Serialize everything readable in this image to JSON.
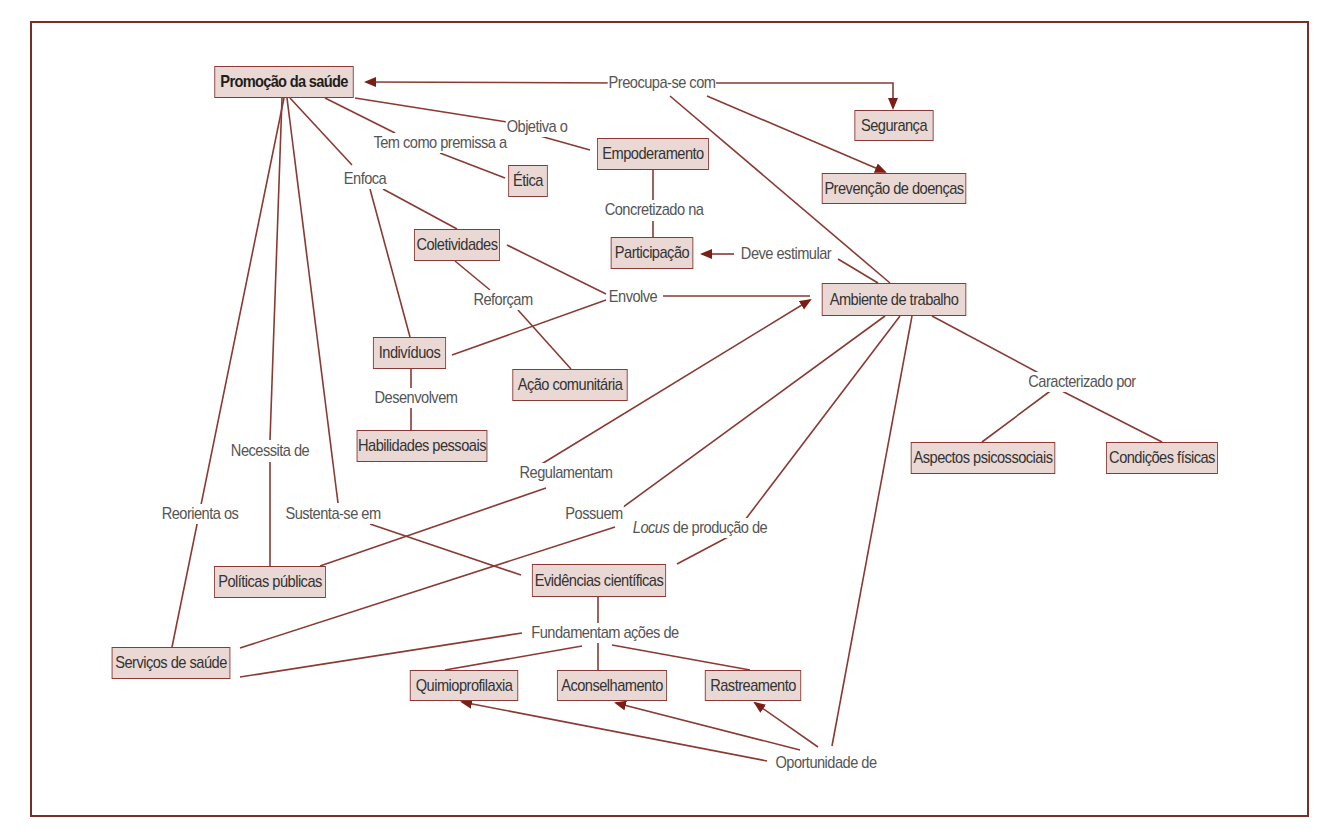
{
  "diagram": {
    "type": "concept-map",
    "colors": {
      "frame": "#7a2e26",
      "edge": "#8a3a32",
      "arrow": "#7a1e16",
      "node_fill": "#ead8d4",
      "node_border": "#8a3a32",
      "label_text": "#555555"
    },
    "nodes": [
      {
        "id": "promocao",
        "label": "Promoção da saúde",
        "x": 203,
        "y": 66,
        "w": 162,
        "h": 32,
        "root": true
      },
      {
        "id": "seguranca",
        "label": "Segurança",
        "x": 848,
        "y": 110,
        "w": 92,
        "h": 31
      },
      {
        "id": "prevencao",
        "label": "Prevenção de doenças",
        "x": 810,
        "y": 173,
        "w": 168,
        "h": 31
      },
      {
        "id": "empoderamento",
        "label": "Empoderamento",
        "x": 588,
        "y": 138,
        "w": 130,
        "h": 32
      },
      {
        "id": "etica",
        "label": "Ética",
        "x": 505,
        "y": 165,
        "w": 46,
        "h": 32
      },
      {
        "id": "coletividades",
        "label": "Coletividades",
        "x": 407,
        "y": 229,
        "w": 100,
        "h": 32
      },
      {
        "id": "participacao",
        "label": "Participação",
        "x": 604,
        "y": 237,
        "w": 96,
        "h": 32
      },
      {
        "id": "ambiente",
        "label": "Ambiente de trabalho",
        "x": 810,
        "y": 283,
        "w": 168,
        "h": 33
      },
      {
        "id": "individuos",
        "label": "Indivíduos",
        "x": 367,
        "y": 337,
        "w": 85,
        "h": 32
      },
      {
        "id": "acao",
        "label": "Ação comunitária",
        "x": 503,
        "y": 369,
        "w": 134,
        "h": 32
      },
      {
        "id": "habilidades",
        "label": "Habilidades pessoais",
        "x": 346,
        "y": 430,
        "w": 152,
        "h": 32
      },
      {
        "id": "aspectos",
        "label": "Aspectos psicossociais",
        "x": 899,
        "y": 442,
        "w": 168,
        "h": 32
      },
      {
        "id": "condicoes",
        "label": "Condições físicas",
        "x": 1097,
        "y": 442,
        "w": 130,
        "h": 32
      },
      {
        "id": "politicas",
        "label": "Políticas públicas",
        "x": 205,
        "y": 566,
        "w": 130,
        "h": 32
      },
      {
        "id": "evidencias",
        "label": "Evidências científicas",
        "x": 521,
        "y": 564,
        "w": 156,
        "h": 33
      },
      {
        "id": "servicos",
        "label": "Serviços de saúde",
        "x": 102,
        "y": 647,
        "w": 138,
        "h": 32
      },
      {
        "id": "quimio",
        "label": "Quimioprofilaxia",
        "x": 401,
        "y": 670,
        "w": 126,
        "h": 31
      },
      {
        "id": "aconselhamento",
        "label": "Aconselhamento",
        "x": 548,
        "y": 670,
        "w": 128,
        "h": 31
      },
      {
        "id": "rastreamento",
        "label": "Rastreamento",
        "x": 697,
        "y": 670,
        "w": 112,
        "h": 31
      }
    ],
    "labels": [
      {
        "id": "preocupa",
        "text": "Preocupa-se com",
        "x": 662,
        "y": 83
      },
      {
        "id": "objetiva",
        "text": "Objetiva o",
        "x": 537,
        "y": 127
      },
      {
        "id": "premissa",
        "text": "Tem como premissa a",
        "x": 440,
        "y": 143
      },
      {
        "id": "enfoca",
        "text": "Enfoca",
        "x": 365,
        "y": 179
      },
      {
        "id": "concretizado",
        "text": "Concretizado na",
        "x": 654,
        "y": 210
      },
      {
        "id": "estimular",
        "text": "Deve estimular",
        "x": 786,
        "y": 254
      },
      {
        "id": "reforcam",
        "text": "Reforçam",
        "x": 503,
        "y": 300
      },
      {
        "id": "envolve",
        "text": "Envolve",
        "x": 633,
        "y": 297
      },
      {
        "id": "desenvolvem",
        "text": "Desenvolvem",
        "x": 416,
        "y": 398
      },
      {
        "id": "caracterizado",
        "text": "Caracterizado por",
        "x": 1082,
        "y": 382
      },
      {
        "id": "necessita",
        "text": "Necessita de",
        "x": 270,
        "y": 451
      },
      {
        "id": "regulamentam",
        "text": "Regulamentam",
        "x": 566,
        "y": 473
      },
      {
        "id": "reorienta",
        "text": "Reorienta os",
        "x": 200,
        "y": 514
      },
      {
        "id": "sustenta",
        "text": "Sustenta-se em",
        "x": 333,
        "y": 514
      },
      {
        "id": "possuem",
        "text": "Possuem",
        "x": 594,
        "y": 514
      },
      {
        "id": "locus",
        "text_italic": "Locus",
        "text": " de produção de",
        "x": 700,
        "y": 528
      },
      {
        "id": "fundamentam",
        "text": "Fundamentam ações de",
        "x": 605,
        "y": 633
      },
      {
        "id": "oportunidade",
        "text": "Oportunidade de",
        "x": 826,
        "y": 763
      }
    ],
    "edges": [
      {
        "points": [
          [
            620,
            83
          ],
          [
            366,
            82
          ]
        ],
        "arrow": "end"
      },
      {
        "points": [
          [
            705,
            83
          ],
          [
            893,
            83
          ],
          [
            893,
            108
          ]
        ],
        "arrow": "end"
      },
      {
        "points": [
          [
            707,
            96
          ],
          [
            885,
            172
          ]
        ],
        "arrow": "end"
      },
      {
        "points": [
          [
            670,
            96
          ],
          [
            890,
            283
          ]
        ],
        "arrow": "none"
      },
      {
        "points": [
          [
            355,
            98
          ],
          [
            507,
            122
          ]
        ],
        "arrow": "none"
      },
      {
        "points": [
          [
            540,
            136
          ],
          [
            590,
            150
          ]
        ],
        "arrow": "none"
      },
      {
        "points": [
          [
            325,
            98
          ],
          [
            395,
            133
          ]
        ],
        "arrow": "none"
      },
      {
        "points": [
          [
            440,
            153
          ],
          [
            505,
            178
          ]
        ],
        "arrow": "none"
      },
      {
        "points": [
          [
            290,
            98
          ],
          [
            352,
            165
          ]
        ],
        "arrow": "none"
      },
      {
        "points": [
          [
            383,
            189
          ],
          [
            457,
            229
          ]
        ],
        "arrow": "none"
      },
      {
        "points": [
          [
            370,
            189
          ],
          [
            410,
            337
          ]
        ],
        "arrow": "none"
      },
      {
        "points": [
          [
            653,
            170
          ],
          [
            653,
            200
          ]
        ],
        "arrow": "none"
      },
      {
        "points": [
          [
            653,
            221
          ],
          [
            653,
            237
          ]
        ],
        "arrow": "none"
      },
      {
        "points": [
          [
            734,
            254
          ],
          [
            702,
            254
          ]
        ],
        "arrow": "end"
      },
      {
        "points": [
          [
            838,
            259
          ],
          [
            878,
            283
          ]
        ],
        "arrow": "none"
      },
      {
        "points": [
          [
            507,
            245
          ],
          [
            606,
            294
          ]
        ],
        "arrow": "none"
      },
      {
        "points": [
          [
            452,
            355
          ],
          [
            606,
            300
          ]
        ],
        "arrow": "none"
      },
      {
        "points": [
          [
            663,
            296
          ],
          [
            810,
            296
          ]
        ],
        "arrow": "none"
      },
      {
        "points": [
          [
            455,
            261
          ],
          [
            490,
            290
          ]
        ],
        "arrow": "none"
      },
      {
        "points": [
          [
            518,
            310
          ],
          [
            571,
            369
          ]
        ],
        "arrow": "none"
      },
      {
        "points": [
          [
            411,
            369
          ],
          [
            411,
            388
          ]
        ],
        "arrow": "none"
      },
      {
        "points": [
          [
            411,
            408
          ],
          [
            411,
            430
          ]
        ],
        "arrow": "none"
      },
      {
        "points": [
          [
            932,
            316
          ],
          [
            1048,
            378
          ]
        ],
        "arrow": "none"
      },
      {
        "points": [
          [
            1053,
            389
          ],
          [
            982,
            442
          ]
        ],
        "arrow": "none"
      },
      {
        "points": [
          [
            1058,
            389
          ],
          [
            1162,
            442
          ]
        ],
        "arrow": "none"
      },
      {
        "points": [
          [
            284,
            98
          ],
          [
            172,
            647
          ]
        ],
        "arrow": "none"
      },
      {
        "points": [
          [
            282,
            98
          ],
          [
            270,
            440
          ]
        ],
        "arrow": "none"
      },
      {
        "points": [
          [
            270,
            462
          ],
          [
            270,
            566
          ]
        ],
        "arrow": "none"
      },
      {
        "points": [
          [
            287,
            98
          ],
          [
            338,
            503
          ]
        ],
        "arrow": "none"
      },
      {
        "points": [
          [
            370,
            524
          ],
          [
            521,
            575
          ]
        ],
        "arrow": "none"
      },
      {
        "points": [
          [
            320,
            566
          ],
          [
            546,
            488
          ]
        ],
        "arrow": "none"
      },
      {
        "points": [
          [
            540,
            465
          ],
          [
            810,
            300
          ]
        ],
        "arrow": "end"
      },
      {
        "points": [
          [
            240,
            648
          ],
          [
            615,
            527
          ]
        ],
        "arrow": "none"
      },
      {
        "points": [
          [
            615,
            513
          ],
          [
            885,
            316
          ]
        ],
        "arrow": "none"
      },
      {
        "points": [
          [
            677,
            564
          ],
          [
            728,
            537
          ]
        ],
        "arrow": "none"
      },
      {
        "points": [
          [
            745,
            520
          ],
          [
            900,
            316
          ]
        ],
        "arrow": "none"
      },
      {
        "points": [
          [
            598,
            597
          ],
          [
            598,
            624
          ]
        ],
        "arrow": "none"
      },
      {
        "points": [
          [
            240,
            677
          ],
          [
            522,
            633
          ]
        ],
        "arrow": "none"
      },
      {
        "points": [
          [
            582,
            646
          ],
          [
            445,
            670
          ]
        ],
        "arrow": "none"
      },
      {
        "points": [
          [
            598,
            643
          ],
          [
            598,
            670
          ]
        ],
        "arrow": "none"
      },
      {
        "points": [
          [
            612,
            645
          ],
          [
            750,
            670
          ]
        ],
        "arrow": "none"
      },
      {
        "points": [
          [
            912,
            316
          ],
          [
            832,
            746
          ]
        ],
        "arrow": "none"
      },
      {
        "points": [
          [
            767,
            761
          ],
          [
            462,
            702
          ]
        ],
        "arrow": "end"
      },
      {
        "points": [
          [
            800,
            750
          ],
          [
            616,
            703
          ]
        ],
        "arrow": "end"
      },
      {
        "points": [
          [
            818,
            747
          ],
          [
            755,
            703
          ]
        ],
        "arrow": "end"
      }
    ]
  }
}
